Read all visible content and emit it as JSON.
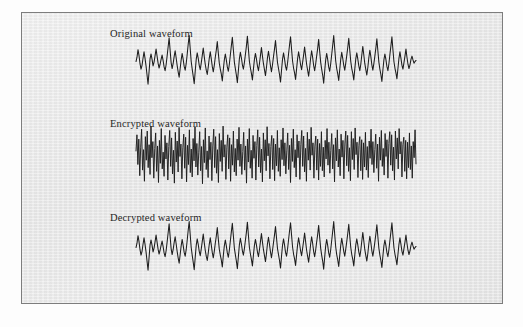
{
  "figure": {
    "background_color": "#e9e9e9",
    "border_color": "#7d7d7d",
    "trace_color": "#1d1d1d",
    "panels": [
      {
        "id": "original",
        "label": "Original waveform"
      },
      {
        "id": "encrypted",
        "label": "Encrypted waveform"
      },
      {
        "id": "decrypted",
        "label": "Decrypted waveform"
      }
    ]
  },
  "chart_data": [
    {
      "type": "line",
      "title": "Original waveform",
      "xlabel": "",
      "ylabel": "",
      "grid": false,
      "legend": "none",
      "xlim": [
        0,
        280
      ],
      "ylim": [
        -1,
        1
      ],
      "description": "Quasi-periodic speech-like amplitude trace, roughly 24 pitch pulses, peaks reaching +1 and troughs near -1.",
      "series": [
        {
          "name": "amplitude",
          "values": [
            -0.02,
            0.14,
            0.42,
            0.2,
            -0.1,
            -0.3,
            -0.16,
            0.1,
            0.34,
            0.1,
            -0.18,
            -0.52,
            -0.86,
            -0.4,
            0.08,
            0.26,
            0.06,
            -0.18,
            -0.04,
            0.2,
            0.44,
            0.18,
            -0.08,
            -0.26,
            -0.12,
            0.06,
            0.22,
            0.02,
            -0.22,
            -0.36,
            -0.14,
            0.18,
            0.52,
            0.86,
            0.4,
            -0.06,
            -0.28,
            -0.1,
            0.16,
            0.38,
            0.12,
            -0.16,
            -0.4,
            -0.6,
            -0.28,
            0.04,
            0.28,
            0.06,
            -0.2,
            -0.34,
            -0.1,
            0.24,
            0.62,
            0.94,
            0.46,
            -0.02,
            -0.3,
            -0.56,
            -0.84,
            -0.38,
            0.06,
            0.3,
            0.1,
            -0.16,
            -0.32,
            -0.08,
            0.2,
            0.48,
            0.16,
            -0.12,
            -0.34,
            -0.5,
            -0.22,
            0.1,
            0.34,
            0.08,
            -0.2,
            -0.4,
            -0.16,
            0.14,
            0.4,
            0.72,
            0.3,
            -0.08,
            -0.3,
            -0.48,
            -0.74,
            -0.32,
            0.04,
            0.26,
            0.04,
            -0.22,
            -0.38,
            -0.12,
            0.22,
            0.56,
            0.88,
            0.42,
            -0.04,
            -0.28,
            -0.52,
            -0.8,
            -0.36,
            0.08,
            0.32,
            0.12,
            -0.14,
            -0.3,
            -0.06,
            0.24,
            0.54,
            0.92,
            0.44,
            -0.02,
            -0.26,
            -0.46,
            -0.7,
            -0.3,
            0.06,
            0.28,
            0.08,
            -0.18,
            -0.36,
            -0.1,
            0.2,
            0.5,
            0.18,
            -0.1,
            -0.32,
            -0.54,
            -0.24,
            0.12,
            0.36,
            0.1,
            -0.18,
            -0.4,
            -0.14,
            0.16,
            0.44,
            0.76,
            0.34,
            -0.06,
            -0.28,
            -0.5,
            -0.78,
            -0.34,
            0.06,
            0.3,
            0.08,
            -0.2,
            -0.34,
            -0.08,
            0.26,
            0.6,
            0.9,
            0.44,
            0.0,
            -0.26,
            -0.44,
            -0.68,
            -0.3,
            0.08,
            0.34,
            0.12,
            -0.14,
            -0.32,
            -0.06,
            0.22,
            0.52,
            0.2,
            -0.12,
            -0.34,
            -0.56,
            -0.26,
            0.1,
            0.38,
            0.14,
            -0.16,
            -0.36,
            -0.12,
            0.18,
            0.46,
            0.8,
            0.36,
            -0.04,
            -0.3,
            -0.52,
            -0.82,
            -0.38,
            0.04,
            0.28,
            0.06,
            -0.22,
            -0.38,
            -0.1,
            0.24,
            0.58,
            0.94,
            0.46,
            0.0,
            -0.28,
            -0.48,
            -0.72,
            -0.32,
            0.06,
            0.32,
            0.1,
            -0.16,
            -0.34,
            -0.08,
            0.2,
            0.5,
            0.84,
            0.4,
            -0.02,
            -0.28,
            -0.46,
            -0.7,
            -0.3,
            0.08,
            0.3,
            0.08,
            -0.18,
            -0.36,
            -0.12,
            0.22,
            0.54,
            0.22,
            -0.1,
            -0.32,
            -0.52,
            -0.24,
            0.12,
            0.4,
            0.16,
            -0.14,
            -0.34,
            -0.1,
            0.18,
            0.48,
            0.82,
            0.38,
            -0.04,
            -0.3,
            -0.5,
            -0.76,
            -0.34,
            0.04,
            0.26,
            0.06,
            -0.2,
            -0.36,
            -0.1,
            0.24,
            0.56,
            0.9,
            0.42,
            -0.02,
            -0.26,
            -0.44,
            -0.66,
            -0.28,
            0.1,
            0.34,
            0.1,
            -0.16,
            -0.3,
            -0.06,
            0.18,
            0.44,
            0.14,
            -0.12,
            -0.28,
            -0.14,
            0.06,
            0.18,
            0.04,
            -0.08,
            -0.02,
            0.02
          ]
        }
      ]
    },
    {
      "type": "line",
      "title": "Encrypted waveform",
      "xlabel": "",
      "ylabel": "",
      "grid": false,
      "legend": "none",
      "xlim": [
        0,
        560
      ],
      "ylim": [
        -1,
        1
      ],
      "description": "Dense high-frequency noise-like trace with no visible periodicity; amplitude fills the full band.",
      "series": [
        {
          "name": "amplitude",
          "values": [
            0.1,
            0.62,
            -0.34,
            0.48,
            -0.7,
            0.22,
            0.8,
            -0.52,
            0.14,
            -0.88,
            0.56,
            -0.2,
            0.74,
            -0.44,
            0.3,
            -0.66,
            0.9,
            -0.12,
            0.4,
            -0.78,
            0.18,
            0.68,
            -0.56,
            0.26,
            -0.92,
            0.44,
            -0.3,
            0.82,
            -0.48,
            0.06,
            -0.72,
            0.6,
            -0.16,
            0.36,
            -0.84,
            0.24,
            0.76,
            -0.4,
            0.52,
            -0.64,
            0.12,
            -0.94,
            0.7,
            -0.26,
            0.42,
            -0.58,
            0.86,
            -0.08,
            0.32,
            -0.8,
            0.2,
            0.64,
            -0.46,
            0.54,
            -0.9,
            0.28,
            -0.34,
            0.78,
            -0.6,
            0.16,
            -0.74,
            0.5,
            -0.22,
            0.88,
            -0.42,
            0.34,
            -0.68,
            0.06,
            0.72,
            -0.54,
            0.24,
            -0.96,
            0.46,
            -0.28,
            0.84,
            -0.5,
            0.1,
            -0.76,
            0.58,
            -0.18,
            0.38,
            -0.86,
            0.26,
            0.8,
            -0.44,
            0.56,
            -0.62,
            0.14,
            -0.92,
            0.66,
            -0.24,
            0.44,
            -0.56,
            0.9,
            -0.1,
            0.3,
            -0.82,
            0.22,
            0.62,
            -0.48,
            0.52,
            -0.88,
            0.3,
            -0.36,
            0.74,
            -0.58,
            0.18,
            -0.7,
            0.48,
            -0.2,
            0.86,
            -0.4,
            0.32,
            -0.66,
            0.08,
            0.7,
            -0.52,
            0.26,
            -0.94,
            0.48,
            -0.26,
            0.82,
            -0.46,
            0.12,
            -0.78,
            0.6,
            -0.14,
            0.4,
            -0.84,
            0.28,
            0.78,
            -0.42,
            0.54,
            -0.6,
            0.16,
            -0.9,
            0.68,
            -0.22,
            0.46,
            -0.54,
            0.88,
            -0.06,
            0.34,
            -0.8,
            0.24,
            0.6,
            -0.5,
            0.5,
            -0.86,
            0.32,
            -0.38,
            0.76,
            -0.56,
            0.2,
            -0.72,
            0.46,
            -0.18,
            0.84,
            -0.38,
            0.36,
            -0.64,
            0.1,
            0.68,
            -0.5,
            0.28,
            -0.92,
            0.5,
            -0.24,
            0.8,
            -0.44,
            0.14,
            -0.74,
            0.62,
            -0.12,
            0.42,
            -0.82,
            0.3,
            0.76,
            -0.4,
            0.58,
            -0.58,
            0.18,
            -0.88,
            0.7,
            -0.2,
            0.48,
            -0.52,
            0.86,
            -0.04,
            0.36,
            -0.78,
            0.26,
            0.58,
            -0.52,
            0.48,
            -0.84,
            0.34,
            -0.4,
            0.72,
            -0.54,
            0.22,
            -0.74,
            0.44,
            -0.16,
            0.82,
            -0.36,
            0.38,
            -0.62,
            0.12,
            0.66,
            -0.48,
            0.3,
            -0.9,
            0.52,
            -0.22,
            0.78,
            -0.42,
            0.16,
            -0.7,
            0.64,
            -0.1,
            0.44,
            -0.8,
            0.32,
            0.74,
            -0.38,
            0.6,
            -0.56,
            0.2,
            -0.86,
            0.72,
            -0.18,
            0.5,
            -0.5,
            0.84,
            -0.02,
            0.38,
            -0.76,
            0.28,
            0.56,
            -0.54,
            0.46,
            -0.82,
            0.36,
            -0.42,
            0.7,
            -0.52,
            0.24,
            -0.76,
            0.42,
            -0.14,
            0.8,
            -0.34,
            0.4,
            -0.6,
            0.14,
            0.64,
            -0.46,
            0.32,
            -0.88,
            0.54,
            -0.2,
            0.76,
            -0.4,
            0.18,
            -0.68,
            0.66,
            -0.08,
            0.46,
            -0.78,
            0.34,
            0.72,
            -0.36,
            0.62,
            -0.54,
            0.22,
            -0.84,
            0.74,
            -0.16,
            0.52,
            -0.48,
            0.82,
            0.0,
            0.4,
            -0.74,
            0.3,
            0.54,
            -0.56,
            0.44,
            -0.8,
            0.38,
            -0.44,
            0.68,
            -0.5,
            0.26,
            -0.78,
            0.4,
            -0.12,
            0.78,
            -0.32
          ]
        }
      ]
    },
    {
      "type": "line",
      "title": "Decrypted waveform",
      "xlabel": "",
      "ylabel": "",
      "grid": false,
      "legend": "none",
      "xlim": [
        0,
        280
      ],
      "ylim": [
        -1,
        1
      ],
      "description": "Recovered trace visually identical to the original waveform, confirming successful decryption.",
      "series": [
        {
          "name": "amplitude",
          "values": [
            -0.02,
            0.14,
            0.42,
            0.2,
            -0.1,
            -0.3,
            -0.16,
            0.1,
            0.34,
            0.1,
            -0.18,
            -0.52,
            -0.86,
            -0.4,
            0.08,
            0.26,
            0.06,
            -0.18,
            -0.04,
            0.2,
            0.44,
            0.18,
            -0.08,
            -0.26,
            -0.12,
            0.06,
            0.22,
            0.02,
            -0.22,
            -0.36,
            -0.14,
            0.18,
            0.52,
            0.86,
            0.4,
            -0.06,
            -0.28,
            -0.1,
            0.16,
            0.38,
            0.12,
            -0.16,
            -0.4,
            -0.6,
            -0.28,
            0.04,
            0.28,
            0.06,
            -0.2,
            -0.34,
            -0.1,
            0.24,
            0.62,
            0.94,
            0.46,
            -0.02,
            -0.3,
            -0.56,
            -0.84,
            -0.38,
            0.06,
            0.3,
            0.1,
            -0.16,
            -0.32,
            -0.08,
            0.2,
            0.48,
            0.16,
            -0.12,
            -0.34,
            -0.5,
            -0.22,
            0.1,
            0.34,
            0.08,
            -0.2,
            -0.4,
            -0.16,
            0.14,
            0.4,
            0.72,
            0.3,
            -0.08,
            -0.3,
            -0.48,
            -0.74,
            -0.32,
            0.04,
            0.26,
            0.04,
            -0.22,
            -0.38,
            -0.12,
            0.22,
            0.56,
            0.88,
            0.42,
            -0.04,
            -0.28,
            -0.52,
            -0.8,
            -0.36,
            0.08,
            0.32,
            0.12,
            -0.14,
            -0.3,
            -0.06,
            0.24,
            0.54,
            0.92,
            0.44,
            -0.02,
            -0.26,
            -0.46,
            -0.7,
            -0.3,
            0.06,
            0.28,
            0.08,
            -0.18,
            -0.36,
            -0.1,
            0.2,
            0.5,
            0.18,
            -0.1,
            -0.32,
            -0.54,
            -0.24,
            0.12,
            0.36,
            0.1,
            -0.18,
            -0.4,
            -0.14,
            0.16,
            0.44,
            0.76,
            0.34,
            -0.06,
            -0.28,
            -0.5,
            -0.78,
            -0.34,
            0.06,
            0.3,
            0.08,
            -0.2,
            -0.34,
            -0.08,
            0.26,
            0.6,
            0.9,
            0.44,
            0.0,
            -0.26,
            -0.44,
            -0.68,
            -0.3,
            0.08,
            0.34,
            0.12,
            -0.14,
            -0.32,
            -0.06,
            0.22,
            0.52,
            0.2,
            -0.12,
            -0.34,
            -0.56,
            -0.26,
            0.1,
            0.38,
            0.14,
            -0.16,
            -0.36,
            -0.12,
            0.18,
            0.46,
            0.8,
            0.36,
            -0.04,
            -0.3,
            -0.52,
            -0.82,
            -0.38,
            0.04,
            0.28,
            0.06,
            -0.22,
            -0.38,
            -0.1,
            0.24,
            0.58,
            0.94,
            0.46,
            0.0,
            -0.28,
            -0.48,
            -0.72,
            -0.32,
            0.06,
            0.32,
            0.1,
            -0.16,
            -0.34,
            -0.08,
            0.2,
            0.5,
            0.84,
            0.4,
            -0.02,
            -0.28,
            -0.46,
            -0.7,
            -0.3,
            0.08,
            0.3,
            0.08,
            -0.18,
            -0.36,
            -0.12,
            0.22,
            0.54,
            0.22,
            -0.1,
            -0.32,
            -0.52,
            -0.24,
            0.12,
            0.4,
            0.16,
            -0.14,
            -0.34,
            -0.1,
            0.18,
            0.48,
            0.82,
            0.38,
            -0.04,
            -0.3,
            -0.5,
            -0.76,
            -0.34,
            0.04,
            0.26,
            0.06,
            -0.2,
            -0.36,
            -0.1,
            0.24,
            0.56,
            0.9,
            0.42,
            -0.02,
            -0.26,
            -0.44,
            -0.66,
            -0.28,
            0.1,
            0.34,
            0.1,
            -0.16,
            -0.3,
            -0.06,
            0.18,
            0.44,
            0.14,
            -0.12,
            -0.28,
            -0.14,
            0.06,
            0.18,
            0.04,
            -0.08,
            -0.02,
            0.02
          ]
        }
      ]
    }
  ]
}
